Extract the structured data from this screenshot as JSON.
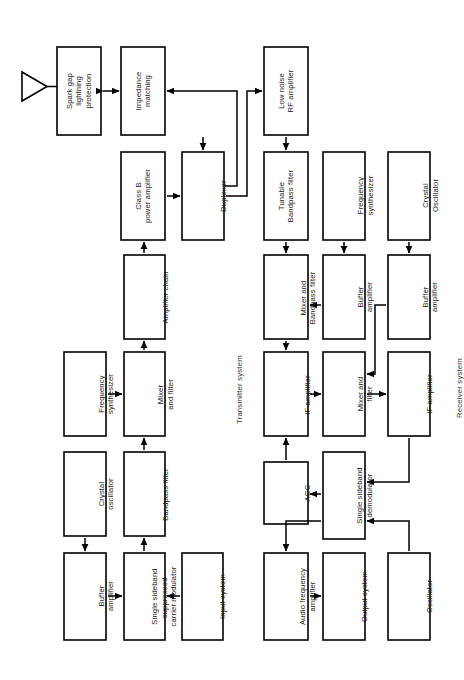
{
  "diagram": {
    "orientation": "rotated-90-ccw",
    "stroke_color": "#000000",
    "fill_color": "#ffffff",
    "background": "#ffffff",
    "system_labels": [
      {
        "id": "transmitter-system",
        "text": "Transmitter system"
      },
      {
        "id": "receiver-system",
        "text": "Receiver system"
      }
    ],
    "antenna": {
      "id": "antenna",
      "label": "antenna"
    },
    "blocks": [
      {
        "id": "spark-gap-lightning-protection",
        "text": "Spark gap\nlightning\nprotection"
      },
      {
        "id": "impedance-matching",
        "text": "Impedance\nmatching"
      },
      {
        "id": "class-b-power-amplifier",
        "text": "Class B\npower amplifier"
      },
      {
        "id": "duplexer",
        "text": "Duplexer"
      },
      {
        "id": "amplifier-chain",
        "text": "Amplifier chain"
      },
      {
        "id": "frequency-synthesizer-tx",
        "text": "Frequency\nsynthesizer"
      },
      {
        "id": "mixer-and-filter-tx",
        "text": "Mixer\nand filter"
      },
      {
        "id": "crystal-oscillator-tx",
        "text": "Crystal\noscillator"
      },
      {
        "id": "bandpass-filter-tx",
        "text": "Bandpass filter"
      },
      {
        "id": "buffer-amplifier-tx",
        "text": "Buffer\namplifier"
      },
      {
        "id": "single-sideband-suppressed-carrier-modulator",
        "text": "Single sideband\nsuppressed-\ncarrier modulator"
      },
      {
        "id": "input-system",
        "text": "Input system"
      },
      {
        "id": "low-noise-rf-amplifier",
        "text": "Low  noise\nRF amplifier"
      },
      {
        "id": "tunable-bandpass-filter",
        "text": "Tunable\nBandpass filter"
      },
      {
        "id": "frequency-synthesizer-rx",
        "text": "Frequency\nsynthesizer"
      },
      {
        "id": "crystal-oscillator-rx",
        "text": "Crystal\nOscillator"
      },
      {
        "id": "mixer-and-bandpass-filter",
        "text": "Mixer and\nBandpass filter"
      },
      {
        "id": "buffer-amplifier-rx-1",
        "text": "Buffer\namplifier"
      },
      {
        "id": "buffer-amplifier-rx-2",
        "text": "Buffer\namplifier"
      },
      {
        "id": "if-amplifier-1",
        "text": "IF amplifier"
      },
      {
        "id": "mixer-and-filter-rx",
        "text": "Mixer and\nfilter"
      },
      {
        "id": "if-amplifier-2",
        "text": "IF amplifier"
      },
      {
        "id": "agc",
        "text": "AGC"
      },
      {
        "id": "single-sideband-demodulator",
        "text": "Single sideband\ndemodulator"
      },
      {
        "id": "audio-frequency-amplifier",
        "text": "Audio frequency\namplifier"
      },
      {
        "id": "output-system",
        "text": "Output system"
      },
      {
        "id": "oscillator-rx",
        "text": "Oscillator"
      }
    ]
  }
}
